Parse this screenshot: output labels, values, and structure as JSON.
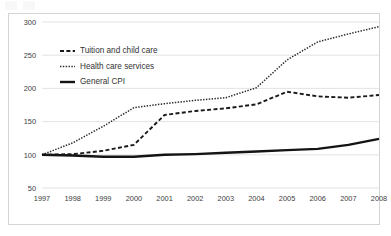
{
  "chart_data": {
    "type": "line",
    "title": "",
    "subtitle": "",
    "xlabel": "",
    "ylabel": "",
    "x": [
      1997,
      1998,
      1999,
      2000,
      2001,
      2002,
      2003,
      2004,
      2005,
      2006,
      2007,
      2008
    ],
    "categories": [
      "1997",
      "1998",
      "1999",
      "2000",
      "2001",
      "2002",
      "2003",
      "2004",
      "2005",
      "2006",
      "2007",
      "2008"
    ],
    "xlim": [
      1997,
      2008
    ],
    "ylim": [
      50,
      300
    ],
    "yticks": [
      50,
      100,
      150,
      200,
      250,
      300
    ],
    "ytick_labels": [
      "50",
      "100",
      "150",
      "200",
      "250",
      "300"
    ],
    "xtick_labels": [
      "1997",
      "1998",
      "1999",
      "2000",
      "2001",
      "2002",
      "2003",
      "2004",
      "2005",
      "2006",
      "2007",
      "2008"
    ],
    "grid": true,
    "grid_axis": "y",
    "legend_position": "upper-left-inside",
    "index_base": 100,
    "series": [
      {
        "name": "Tuition and child care",
        "style": "dashed",
        "color": "#1a1a1a",
        "width": 1.9,
        "values": [
          100,
          101,
          106,
          115,
          160,
          166,
          170,
          176,
          195,
          188,
          186,
          190
        ]
      },
      {
        "name": "Health care services",
        "style": "dotted",
        "color": "#2b2b2b",
        "width": 1.5,
        "values": [
          100,
          118,
          143,
          171,
          177,
          182,
          186,
          201,
          243,
          270,
          282,
          293
        ]
      },
      {
        "name": "General CPI",
        "style": "solid",
        "color": "#141414",
        "width": 2.4,
        "values": [
          100,
          99,
          97,
          97,
          100,
          101,
          103,
          105,
          107,
          109,
          115,
          124
        ]
      }
    ]
  },
  "legend": {
    "items": [
      {
        "label": "Tuition and child care",
        "style": "dashed"
      },
      {
        "label": "Health care services",
        "style": "dotted"
      },
      {
        "label": "General CPI",
        "style": "solid"
      }
    ]
  },
  "colors": {
    "background": "#ffffff",
    "frame_border": "#d4d4d4",
    "gridline": "#dcdcdc",
    "axis_text": "#404040",
    "legend_text": "#333333"
  }
}
